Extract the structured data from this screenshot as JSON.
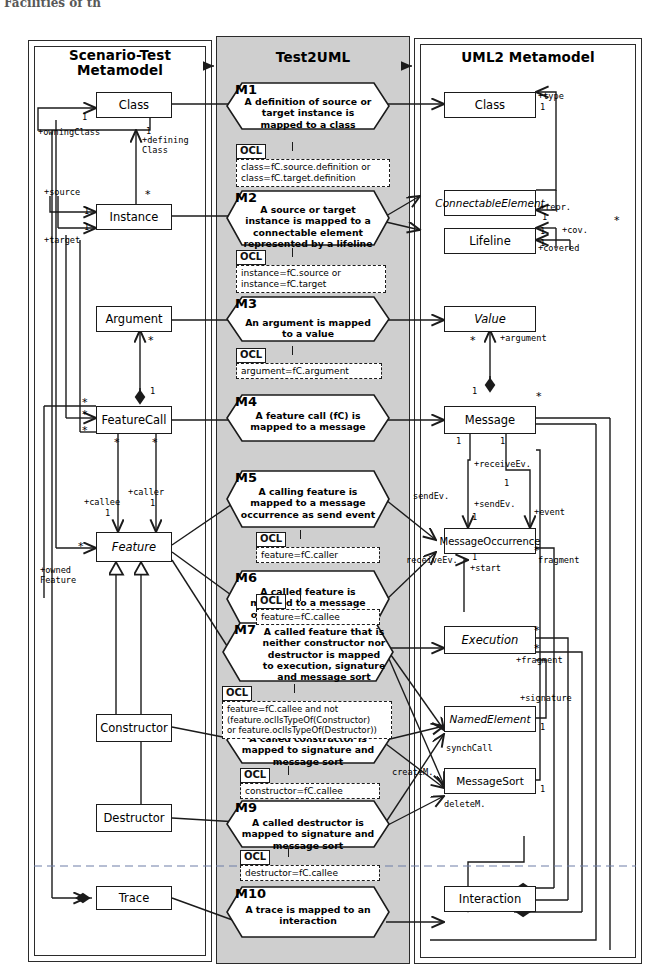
{
  "top_fragment": "Facilities of th",
  "panels": {
    "left": {
      "title_line1": "Scenario-Test",
      "title_line2": "Metamodel"
    },
    "middle": {
      "title": "Test2UML"
    },
    "right": {
      "title": "UML2 Metamodel"
    }
  },
  "left_classes": [
    {
      "name": "Class"
    },
    {
      "name": "Instance"
    },
    {
      "name": "Argument"
    },
    {
      "name": "FeatureCall"
    },
    {
      "name": "Feature"
    },
    {
      "name": "Constructor"
    },
    {
      "name": "Destructor"
    },
    {
      "name": "Trace"
    }
  ],
  "right_classes": [
    {
      "name": "Class"
    },
    {
      "name": "ConnectableElement"
    },
    {
      "name": "Lifeline"
    },
    {
      "name": "Value"
    },
    {
      "name": "Message"
    },
    {
      "name": "MessageOccurrence"
    },
    {
      "name": "Execution"
    },
    {
      "name": "NamedElement"
    },
    {
      "name": "MessageSort"
    },
    {
      "name": "Interaction"
    }
  ],
  "rules": [
    {
      "id": "M1",
      "text": "A definition of source or target instance is mapped to a class"
    },
    {
      "id": "M2",
      "text": "A source or target instance is mapped to a connectable element represented by a lifeline"
    },
    {
      "id": "M3",
      "text": "An argument is mapped to a value"
    },
    {
      "id": "M4",
      "text": "A feature call (fC) is mapped to a message"
    },
    {
      "id": "M5",
      "text": "A calling feature is mapped to a message occurrence as send event"
    },
    {
      "id": "M6",
      "text": "A called feature is mapped to a message occurrence as receive event"
    },
    {
      "id": "M7",
      "text": "A called feature that is neither constructor nor destructor is mapped to execution, signature and message sort"
    },
    {
      "id": "M8",
      "text": "A called constructor is mapped to signature and message sort"
    },
    {
      "id": "M9",
      "text": "A called destructor is mapped to signature and message sort"
    },
    {
      "id": "M10",
      "text": "A trace is mapped to an interaction"
    }
  ],
  "ocl": [
    {
      "tag": "OCL",
      "line1": "class=fC.source.definition or",
      "line2": "class=fC.target.definition"
    },
    {
      "tag": "OCL",
      "line1": "instance=fC.source or",
      "line2": "instance=fC.target"
    },
    {
      "tag": "OCL",
      "line1": "argument=fC.argument",
      "line2": ""
    },
    {
      "tag": "OCL",
      "line1": "feature=fC.caller",
      "line2": ""
    },
    {
      "tag": "OCL",
      "line1": "feature=fC.callee",
      "line2": ""
    },
    {
      "tag": "OCL",
      "line1": "feature=fC.callee and not",
      "line2": "(feature.oclIsTypeOf(Constructor)",
      "line3": "or feature.oclIsTypeOf(Destructor))"
    },
    {
      "tag": "OCL",
      "line1": "constructor=fC.callee",
      "line2": ""
    },
    {
      "tag": "OCL",
      "line1": "destructor=fC.callee",
      "line2": ""
    }
  ],
  "left_assoc_labels": [
    "+owningClass",
    "+defining",
    "Class",
    "+source",
    "+target",
    "+callee",
    "+caller",
    "+owned",
    "Feature"
  ],
  "right_assoc_labels": [
    "+type",
    "+repr.",
    "+cov.",
    "+covered",
    "+argument",
    "+receiveEv.",
    "+sendEv.",
    "sendEv.",
    "receiveEv.",
    "+event",
    "fragment",
    "+start",
    "+fragment",
    "+signature",
    "synchCall",
    "deleteM.",
    "createM."
  ],
  "multiplicities": {
    "one": "1",
    "many": "*"
  },
  "colors": {
    "middle_panel_bg": "#cfcfcf",
    "panel_border": "#2b2b2b",
    "box_border": "#1b1b1b",
    "text": "#000000",
    "page_bg": "#ffffff"
  }
}
